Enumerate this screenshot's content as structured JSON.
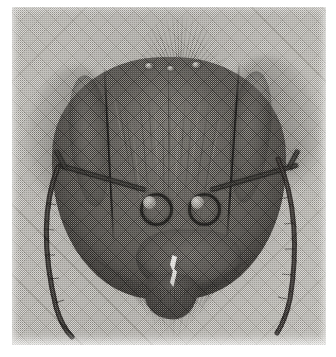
{
  "figure": {
    "medium": "halftone-printed-photograph",
    "plate_background_color": "#c0beb9",
    "ink_color": "#46433f",
    "highlight_color": "#f2f1ee",
    "caption": "",
    "plate": {
      "left": 12,
      "top": 7,
      "width": 314,
      "height": 338
    }
  },
  "anatomy": {
    "head_capsule": {
      "label": "head capsule",
      "left": 40,
      "top": 50,
      "width": 234,
      "height": 242
    },
    "compound_eye_left": {
      "label": "compound eye (left)"
    },
    "compound_eye_right": {
      "label": "compound eye (right)"
    },
    "ocelli": [
      {
        "label": "lateral ocellus left",
        "x": 133,
        "y": 56,
        "size": 9
      },
      {
        "label": "median ocellus",
        "x": 155,
        "y": 59,
        "size": 8
      },
      {
        "label": "lateral ocellus right",
        "x": 180,
        "y": 55,
        "size": 9
      }
    ],
    "antennal_socket_left": {
      "label": "antennal socket (torulus) left",
      "x": 128,
      "y": 186
    },
    "antennal_socket_right": {
      "label": "antennal socket (torulus) right",
      "x": 176,
      "y": 186
    },
    "scape_left": {
      "label": "antennal scape (left)"
    },
    "scape_right": {
      "label": "antennal scape (right)"
    },
    "funiculus_left": {
      "label": "antennal funiculus (left)"
    },
    "funiculus_right": {
      "label": "antennal funiculus (right)"
    },
    "clypeus": {
      "label": "clypeus"
    },
    "mandible_left": {
      "label": "mandible (left)"
    },
    "mandible_right": {
      "label": "mandible (right)"
    },
    "labrum_highlight": {
      "label": "labrum / mandibular gap highlight"
    },
    "vertex_setae": {
      "label": "erect setae on vertex",
      "count": 34
    },
    "ventral_fringe_setae": {
      "label": "fringe setae on lower head margin",
      "count": 46
    },
    "translucent_lobes": {
      "label": "out-of-focus appendages behind head",
      "count": 4
    }
  },
  "setae": {
    "fan_angles": [
      -74,
      -68,
      -61,
      -55,
      -49,
      -43,
      -37,
      -31,
      -26,
      -21,
      -16,
      -11,
      -6,
      -2,
      2,
      6,
      11,
      16,
      21,
      26,
      31,
      37,
      43,
      49,
      55,
      61,
      68,
      74,
      -80,
      80,
      -86,
      86,
      -58,
      58
    ],
    "fan_lengths": [
      30,
      36,
      42,
      47,
      52,
      57,
      60,
      63,
      65,
      67,
      68,
      69,
      70,
      70,
      70,
      70,
      69,
      68,
      67,
      65,
      63,
      60,
      57,
      52,
      47,
      42,
      36,
      30,
      24,
      24,
      18,
      18,
      55,
      55
    ]
  }
}
